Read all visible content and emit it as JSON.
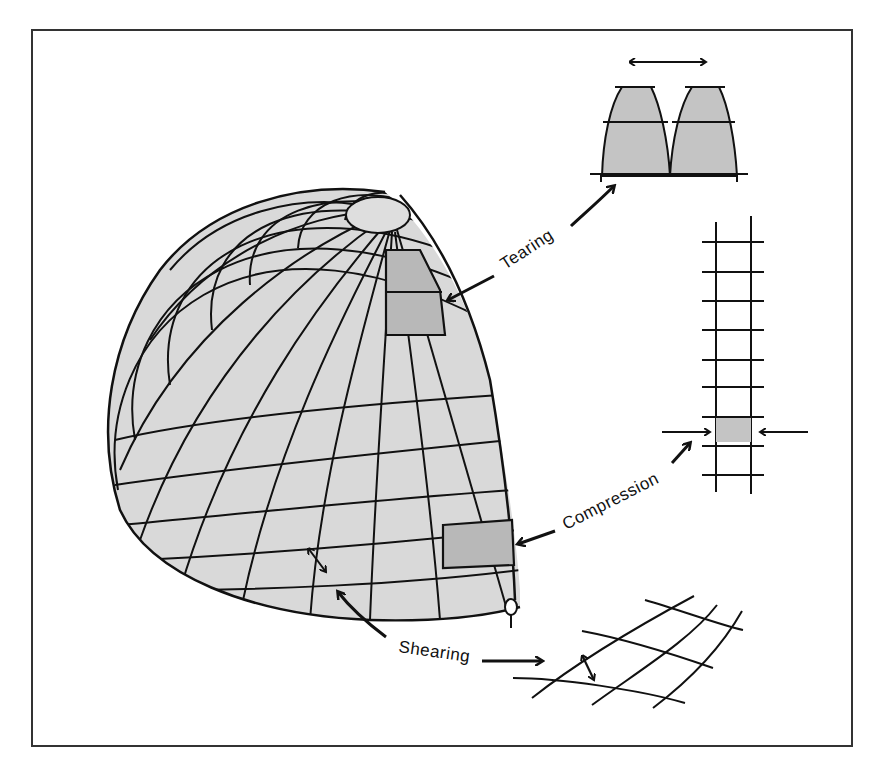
{
  "diagram": {
    "labels": {
      "tearing": "Tearing",
      "compression": "Compression",
      "shearing": "Shearing"
    },
    "colors": {
      "frame": "#333333",
      "ink": "#111111",
      "shell_fill": "#d9d9d9",
      "highlight_fill": "#b8b8b8",
      "background": "#ffffff"
    },
    "insets": [
      {
        "id": "tearing-detail",
        "description": "two tapered gores pulled apart with double-headed arrow"
      },
      {
        "id": "compression-detail",
        "description": "vertical ladder strip with shaded compressed cell and opposing arrows"
      },
      {
        "id": "shearing-detail",
        "description": "skewed grid with double-headed angle arrow"
      }
    ]
  }
}
